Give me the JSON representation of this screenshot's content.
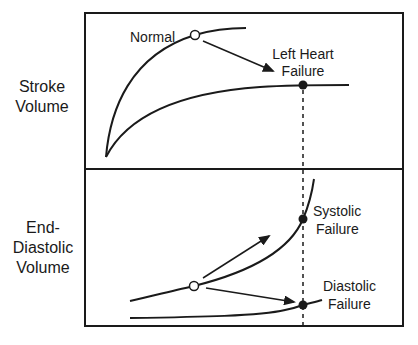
{
  "diagram": {
    "y_labels": {
      "top": [
        "Stroke",
        "Volume"
      ],
      "bottom": [
        "End-",
        "Diastolic",
        "Volume"
      ]
    },
    "annotations": {
      "normal": "Normal",
      "left_heart_failure": [
        "Left Heart",
        "Failure"
      ],
      "systolic_failure": [
        "Systolic",
        "Failure"
      ],
      "diastolic_failure": [
        "Diastolic",
        "Failure"
      ]
    },
    "colors": {
      "ink": "#1a1a1a",
      "background": "#ffffff"
    }
  }
}
